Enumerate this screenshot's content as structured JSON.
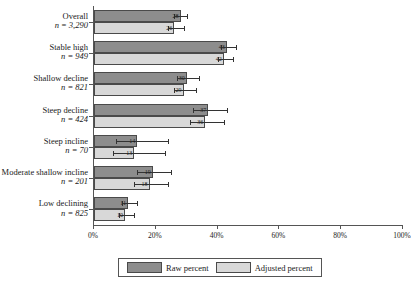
{
  "chart_data": {
    "type": "bar",
    "orientation": "horizontal",
    "title": "",
    "xlabel": "",
    "ylabel": "",
    "xlim": [
      0,
      100
    ],
    "xticks": [
      "0%",
      "20%",
      "40%",
      "60%",
      "80%",
      "100%"
    ],
    "xtick_values": [
      0,
      20,
      40,
      60,
      80,
      100
    ],
    "grid": false,
    "legend_position": "bottom",
    "categories": [
      {
        "name": "Overall",
        "n": "n = 3,290"
      },
      {
        "name": "Stable high",
        "n": "n = 949"
      },
      {
        "name": "Shallow decline",
        "n": "n = 821"
      },
      {
        "name": "Steep decline",
        "n": "n = 424"
      },
      {
        "name": "Steep incline",
        "n": "n = 70"
      },
      {
        "name": "Moderate shallow incline",
        "n": "n = 201"
      },
      {
        "name": "Low declining",
        "n": "n = 825"
      }
    ],
    "series": [
      {
        "name": "Raw percent",
        "color": "#8d8d8d",
        "values": [
          28,
          43,
          30,
          37,
          14,
          19,
          11
        ],
        "labels": [
          "28",
          "43",
          "30",
          "37",
          "14",
          "19",
          "11"
        ],
        "err_low": [
          26,
          41,
          27,
          32,
          7,
          14,
          9
        ],
        "err_high": [
          30,
          46,
          34,
          43,
          24,
          25,
          14
        ]
      },
      {
        "name": "Adjusted percent",
        "color": "#d8d8d8",
        "values": [
          26,
          42,
          29,
          36,
          13,
          18,
          10
        ],
        "labels": [
          "26",
          "42",
          "29",
          "36",
          "13",
          "18",
          "10"
        ],
        "err_low": [
          24,
          40,
          26,
          31,
          6,
          13,
          8
        ],
        "err_high": [
          29,
          45,
          33,
          42,
          23,
          24,
          13
        ]
      }
    ]
  },
  "legend": {
    "items": [
      {
        "label": "Raw percent",
        "swatch": "raw"
      },
      {
        "label": "Adjusted percent",
        "swatch": "adj"
      }
    ]
  }
}
